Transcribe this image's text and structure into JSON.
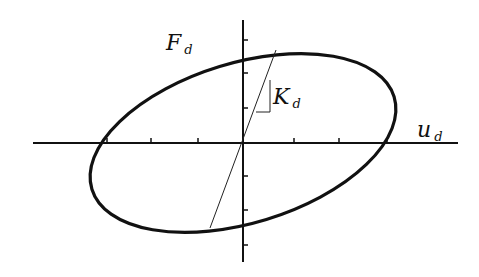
{
  "diagram": {
    "type": "hysteresis-loop",
    "colors": {
      "stroke": "#111111",
      "background": "#ffffff"
    },
    "labels": {
      "force_axis": {
        "main": "F",
        "sub": "d"
      },
      "displacement_axis": {
        "main": "u",
        "sub": "d"
      },
      "stiffness": {
        "main": "K",
        "sub": "d"
      }
    },
    "axes": {
      "origin": [
        243,
        143
      ],
      "x_axis": {
        "from": 33,
        "to": 458,
        "ticks": [
          107,
          151,
          198,
          294,
          339,
          387
        ]
      },
      "y_axis": {
        "from": 20,
        "to": 262,
        "ticks": [
          40,
          73,
          108,
          176,
          210,
          245
        ]
      }
    },
    "ellipse": {
      "cx": 243,
      "cy": 143,
      "rx": 158,
      "ry": 80,
      "rotation_deg": -17
    },
    "stiffness_line": {
      "x1": 210,
      "y1": 228,
      "x2": 276,
      "y2": 50
    },
    "slope_triangle": {
      "points": "256,112 270,112 270,80"
    }
  }
}
